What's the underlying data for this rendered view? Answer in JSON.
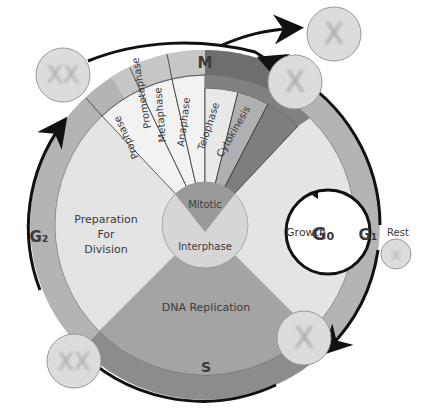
{
  "diagram": {
    "outer_ring_labels": {
      "m": "M",
      "g1": "G₁",
      "g2": "G₂",
      "s": "S",
      "g0": "G₀",
      "rest": "Rest"
    },
    "mitotic_phases": [
      "Prophase",
      "Prometaphase",
      "Metaphase",
      "Anaphase",
      "Telophase",
      "Cytokinesis"
    ],
    "sectors": {
      "g2": {
        "line1": "Preparation",
        "line2": "For",
        "line3": "Division"
      },
      "g1": "Growth",
      "s": "DNA Replication"
    },
    "center": {
      "mitotic": "Mitotic",
      "interphase": "Interphase"
    },
    "colors": {
      "outer_ring": "#b4b4b4",
      "m_ring_light": "#c6c6c6",
      "m_ring_dark": "#6e6e6e",
      "s_ring": "#8c8c8c",
      "interphase_fill": "#e4e4e4",
      "s_sector": "#a4a4a4",
      "phase_light": "#f2f2f2",
      "center_circle": "#d6d6d6",
      "mitotic_wedge": "#9a9a9a",
      "arrow": "#111111",
      "cell": "#dcdcdc",
      "chromosome": "#aaaaaa"
    }
  }
}
